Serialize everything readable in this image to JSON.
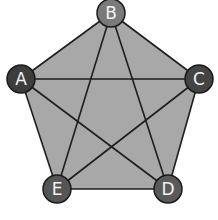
{
  "diagram": {
    "type": "complete-graph-pentagon",
    "colors": {
      "fill": "#a8a8a8",
      "edge": "#1e1e1e",
      "node_stroke": "#1a1a1a",
      "label": "#f2f2f2"
    },
    "nodes": [
      {
        "id": "A",
        "label": "A",
        "x": 21,
        "y": 79,
        "color": "#3d3d3d"
      },
      {
        "id": "B",
        "label": "B",
        "x": 111,
        "y": 13,
        "color": "#7a7a7a"
      },
      {
        "id": "C",
        "label": "C",
        "x": 199,
        "y": 79,
        "color": "#444444"
      },
      {
        "id": "D",
        "label": "D",
        "x": 168,
        "y": 189,
        "color": "#5a5a5a"
      },
      {
        "id": "E",
        "label": "E",
        "x": 57,
        "y": 189,
        "color": "#555555"
      }
    ],
    "edges": [
      [
        "A",
        "B"
      ],
      [
        "A",
        "C"
      ],
      [
        "A",
        "D"
      ],
      [
        "A",
        "E"
      ],
      [
        "B",
        "C"
      ],
      [
        "B",
        "D"
      ],
      [
        "B",
        "E"
      ],
      [
        "C",
        "D"
      ],
      [
        "C",
        "E"
      ],
      [
        "D",
        "E"
      ]
    ]
  }
}
